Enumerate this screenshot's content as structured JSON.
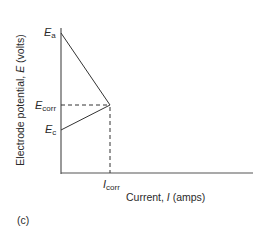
{
  "diagram": {
    "type": "polarization-diagram",
    "y_axis_label": {
      "prefix": "Electrode potential, ",
      "symbol": "E",
      "suffix": " (volts)"
    },
    "x_axis_label": {
      "prefix": "Current, ",
      "symbol": "I",
      "suffix": " (amps)"
    },
    "labels": {
      "Ea": {
        "main": "E",
        "sub": "a"
      },
      "Ecorr": {
        "main": "E",
        "sub": "corr"
      },
      "Ec": {
        "main": "E",
        "sub": "c"
      },
      "Icorr": {
        "main": "I",
        "sub": "corr"
      }
    },
    "panel_label": "(c)",
    "colors": {
      "line": "#333333",
      "text": "#2a2a2a"
    }
  }
}
